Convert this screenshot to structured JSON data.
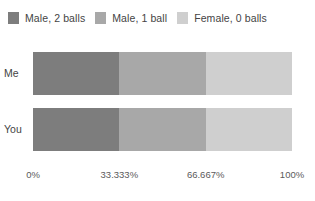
{
  "chart_data": {
    "type": "bar",
    "orientation": "horizontal",
    "stacked": true,
    "normalized": true,
    "title": "",
    "xlabel": "",
    "ylabel": "",
    "categories": [
      "Me",
      "You"
    ],
    "tick_labels": [
      "0%",
      "33.333%",
      "66.667%",
      "100%"
    ],
    "tick_values": [
      0,
      33.333,
      66.667,
      100
    ],
    "xlim": [
      0,
      100
    ],
    "grid": false,
    "legend_position": "top",
    "series": [
      {
        "name": "Male, 2 balls",
        "color": "#7d7d7d",
        "values": [
          33.333,
          33.333
        ]
      },
      {
        "name": "Male, 1 ball",
        "color": "#a8a8a8",
        "values": [
          33.333,
          33.333
        ]
      },
      {
        "name": "Female, 0 balls",
        "color": "#cfcfcf",
        "values": [
          33.334,
          33.334
        ]
      }
    ]
  },
  "legend": {
    "items": [
      {
        "label": "Male, 2 balls",
        "color": "#7d7d7d"
      },
      {
        "label": "Male, 1 ball",
        "color": "#a8a8a8"
      },
      {
        "label": "Female, 0 balls",
        "color": "#cfcfcf"
      }
    ]
  },
  "rows": [
    {
      "label": "Me",
      "segments": [
        {
          "name": "Male, 2 balls",
          "pct": 33.333,
          "color": "#7d7d7d"
        },
        {
          "name": "Male, 1 ball",
          "pct": 33.333,
          "color": "#a8a8a8"
        },
        {
          "name": "Female, 0 balls",
          "pct": 33.334,
          "color": "#cfcfcf"
        }
      ]
    },
    {
      "label": "You",
      "segments": [
        {
          "name": "Male, 2 balls",
          "pct": 33.333,
          "color": "#7d7d7d"
        },
        {
          "name": "Male, 1 ball",
          "pct": 33.333,
          "color": "#a8a8a8"
        },
        {
          "name": "Female, 0 balls",
          "pct": 33.334,
          "color": "#cfcfcf"
        }
      ]
    }
  ],
  "axis": {
    "ticks": [
      {
        "label": "0%",
        "pos": 0
      },
      {
        "label": "33.333%",
        "pos": 33.333
      },
      {
        "label": "66.667%",
        "pos": 66.667
      },
      {
        "label": "100%",
        "pos": 100
      }
    ]
  }
}
